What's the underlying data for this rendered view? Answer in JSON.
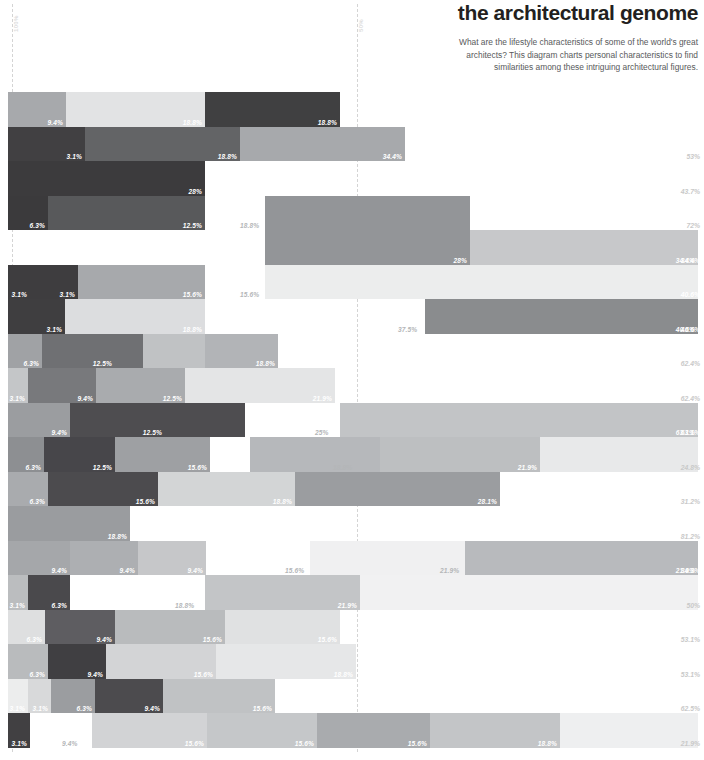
{
  "header": {
    "title": "the architectural genome",
    "subtitle": "What are the lifestyle characteristics of some of the world's great architects? This diagram charts personal characteristics to find similarities among these intriguing architectural figures."
  },
  "axis": {
    "guides": [
      {
        "label": "100%",
        "x": 12
      },
      {
        "label": "50%",
        "x": 357
      }
    ],
    "top": 4,
    "bottom": 752,
    "color": "#d4d4d4"
  },
  "chart_data": {
    "type": "bar",
    "orientation": "horizontal",
    "stacked": true,
    "title": "the architectural genome",
    "xlabel": "",
    "ylabel": "",
    "xlim": [
      0,
      704
    ],
    "grid": false,
    "legend": null,
    "axis_ticks": [
      "100%",
      "50%"
    ],
    "chart_left": 8,
    "chart_right": 698,
    "row_top": 92,
    "row_height": 34.5,
    "rows": [
      {
        "index": 0,
        "total": null,
        "segments": [
          {
            "x": 8,
            "w": 58,
            "color": "#a7a9ac",
            "label": ""
          },
          {
            "x": 66,
            "w": 0,
            "color": "#a7a9ac",
            "label": "9.4%"
          },
          {
            "x": 66,
            "w": 0,
            "color": "#e6e7e8",
            "label": ""
          },
          {
            "x": 66,
            "w": 139,
            "color": "#e2e3e4",
            "label": "18.8%"
          },
          {
            "x": 205,
            "w": 135,
            "color": "#404041",
            "label": "18.8%"
          }
        ]
      },
      {
        "index": 1,
        "total": "53%",
        "total_dark": true,
        "segments": [
          {
            "x": 8,
            "w": 77,
            "color": "#414042",
            "label": "3.1%"
          },
          {
            "x": 85,
            "w": 155,
            "color": "#636466",
            "label": "18.8%"
          },
          {
            "x": 240,
            "w": 165,
            "color": "#a7a9ac",
            "label": "34.4%"
          }
        ]
      },
      {
        "index": 2,
        "total": "43.7%",
        "total_dark": true,
        "segments": [
          {
            "x": 8,
            "w": 197,
            "color": "#3c3b3d",
            "label": "28%"
          }
        ]
      },
      {
        "index": 3,
        "total": "72%",
        "total_dark": true,
        "segments": [
          {
            "x": 8,
            "w": 40,
            "color": "#3b3a3c",
            "label": "6.3%"
          },
          {
            "x": 48,
            "w": 157,
            "color": "#58595b",
            "label": "12.5%"
          },
          {
            "x": 265,
            "w": 205,
            "color": "#939598",
            "label": "18.8%",
            "outside": true,
            "out_x": 240
          },
          {
            "x": 265,
            "w": 0,
            "color": "#939598",
            "label": ""
          }
        ]
      },
      {
        "index": 4,
        "total": "34.4%",
        "segments": [
          {
            "x": 265,
            "w": 205,
            "color": "#939598",
            "label": "28%"
          },
          {
            "x": 470,
            "w": 228,
            "color": "#c7c8ca",
            "label": "34.4%"
          }
        ],
        "merge_with_prev": true
      },
      {
        "index": 5,
        "total": "40.6%",
        "segments": [
          {
            "x": 8,
            "w": 22,
            "color": "#3e3d3f",
            "label": "3.1%"
          },
          {
            "x": 30,
            "w": 48,
            "color": "#3e3d3f",
            "label": "3.1%"
          },
          {
            "x": 78,
            "w": 127,
            "color": "#a7a9ac",
            "label": "15.6%"
          },
          {
            "x": 265,
            "w": 433,
            "color": "#eceded",
            "label": "15.6%",
            "outside": true,
            "out_x": 240
          }
        ]
      },
      {
        "index": 6,
        "total": "40.6%",
        "segments": [
          {
            "x": 8,
            "w": 57,
            "color": "#3f3e40",
            "label": "3.1%"
          },
          {
            "x": 65,
            "w": 140,
            "color": "#dcdddf",
            "label": "18.8%"
          },
          {
            "x": 425,
            "w": 273,
            "color": "#8a8c8e",
            "label": "40.6%",
            "outside_left": "37.5%",
            "out_x": 398
          }
        ]
      },
      {
        "index": 7,
        "total": "62.4%",
        "total_dark": true,
        "segments": [
          {
            "x": 8,
            "w": 34,
            "color": "#a0a2a5",
            "label": "6.3%"
          },
          {
            "x": 42,
            "w": 73,
            "color": "#6f7073",
            "label": "12.5%"
          },
          {
            "x": 115,
            "w": 28,
            "color": "#6f7073",
            "label": ""
          },
          {
            "x": 143,
            "w": 62,
            "color": "#c0c2c4",
            "label": ""
          },
          {
            "x": 205,
            "w": 73,
            "color": "#b2b4b7",
            "label": "18.8%"
          }
        ]
      },
      {
        "index": 8,
        "total": "62.4%",
        "total_dark": true,
        "segments": [
          {
            "x": 8,
            "w": 20,
            "color": "#c4c6c8",
            "label": "3.1%"
          },
          {
            "x": 28,
            "w": 68,
            "color": "#78797c",
            "label": "9.4%"
          },
          {
            "x": 96,
            "w": 89,
            "color": "#a9abae",
            "label": "12.5%"
          },
          {
            "x": 185,
            "w": 150,
            "color": "#e4e5e6",
            "label": "21.9%"
          }
        ]
      },
      {
        "index": 9,
        "total": "63.1%",
        "segments": [
          {
            "x": 8,
            "w": 62,
            "color": "#9b9da0",
            "label": "9.4%"
          },
          {
            "x": 70,
            "w": 95,
            "color": "#4e4d50",
            "label": "12.5%"
          },
          {
            "x": 165,
            "w": 80,
            "color": "#4e4d50",
            "label": ""
          },
          {
            "x": 340,
            "w": 358,
            "color": "#c2c4c6",
            "label": "63.1%",
            "outside_left": "25%",
            "out_x": 315
          }
        ]
      },
      {
        "index": 10,
        "total": "24.8%",
        "total_dark": true,
        "segments": [
          {
            "x": 8,
            "w": 36,
            "color": "#8d8f92",
            "label": "6.3%"
          },
          {
            "x": 44,
            "w": 71,
            "color": "#47464a",
            "label": "12.5%"
          },
          {
            "x": 115,
            "w": 95,
            "color": "#9ea0a3",
            "label": "15.6%"
          },
          {
            "x": 250,
            "w": 130,
            "color": "#b6b8bb",
            "label": "18.8%",
            "outside": true,
            "out_x": 333
          },
          {
            "x": 380,
            "w": 160,
            "color": "#bdbfc1",
            "label": "21.9%"
          },
          {
            "x": 540,
            "w": 158,
            "color": "#e8e9ea",
            "label": ""
          }
        ]
      },
      {
        "index": 11,
        "total": "31.2%",
        "total_dark": true,
        "segments": [
          {
            "x": 8,
            "w": 40,
            "color": "#a9abae",
            "label": "6.3%"
          },
          {
            "x": 48,
            "w": 110,
            "color": "#4c4b4e",
            "label": "15.6%"
          },
          {
            "x": 158,
            "w": 137,
            "color": "#d3d5d6",
            "label": ""
          },
          {
            "x": 295,
            "w": 0,
            "color": "#d3d5d6",
            "label": "18.8%"
          },
          {
            "x": 295,
            "w": 205,
            "color": "#9b9da0",
            "label": "28.1%"
          }
        ]
      },
      {
        "index": 12,
        "total": "81.2%",
        "total_dark": true,
        "segments": [
          {
            "x": 8,
            "w": 122,
            "color": "#9a9c9f",
            "label": "18.8%"
          }
        ]
      },
      {
        "index": 13,
        "total": "34.3%",
        "segments": [
          {
            "x": 8,
            "w": 62,
            "color": "#a5a7aa",
            "label": "9.4%"
          },
          {
            "x": 70,
            "w": 68,
            "color": "#adafb2",
            "label": "9.4%"
          },
          {
            "x": 138,
            "w": 68,
            "color": "#c6c7c9",
            "label": "9.4%"
          },
          {
            "x": 310,
            "w": 155,
            "color": "#f0f0f1",
            "label": "15.6%",
            "outside": true,
            "out_x": 285
          },
          {
            "x": 465,
            "w": 233,
            "color": "#b8babd",
            "label": "21.9%",
            "outside_left": "21.9%",
            "out_x": 440
          }
        ]
      },
      {
        "index": 14,
        "total": "50%",
        "total_dark": true,
        "segments": [
          {
            "x": 8,
            "w": 20,
            "color": "#bbbdbf",
            "label": "3.1%"
          },
          {
            "x": 28,
            "w": 42,
            "color": "#4a494c",
            "label": "6.3%"
          },
          {
            "x": 70,
            "w": 135,
            "color": "#ffffff",
            "label": "18.8%",
            "outside": true,
            "out_x": 175
          },
          {
            "x": 205,
            "w": 155,
            "color": "#c3c5c7",
            "label": "21.9%"
          },
          {
            "x": 360,
            "w": 338,
            "color": "#f1f1f2",
            "label": ""
          }
        ]
      },
      {
        "index": 15,
        "total": "53.1%",
        "total_dark": true,
        "segments": [
          {
            "x": 8,
            "w": 37,
            "color": "#dedfe0",
            "label": "6.3%"
          },
          {
            "x": 45,
            "w": 70,
            "color": "#5e5d61",
            "label": "9.4%"
          },
          {
            "x": 115,
            "w": 110,
            "color": "#b9bbbd",
            "label": "15.6%"
          },
          {
            "x": 225,
            "w": 115,
            "color": "#e0e1e2",
            "label": "15.6%"
          }
        ]
      },
      {
        "index": 16,
        "total": "53.1%",
        "total_dark": true,
        "merge_label_only": true,
        "segments": [
          {
            "x": 8,
            "w": 40,
            "color": "#b9bbbd",
            "label": "6.3%"
          },
          {
            "x": 48,
            "w": 58,
            "color": "#403f42",
            "label": "9.4%"
          },
          {
            "x": 106,
            "w": 110,
            "color": "#d3d4d6",
            "label": "15.6%"
          },
          {
            "x": 216,
            "w": 140,
            "color": "#e6e7e8",
            "label": "18.8%"
          }
        ]
      },
      {
        "index": 17,
        "total": "62.5%",
        "total_dark": true,
        "segments": [
          {
            "x": 8,
            "w": 20,
            "color": "#eceded",
            "label": "3.1%"
          },
          {
            "x": 28,
            "w": 23,
            "color": "#d8d9da",
            "label": "3.1%"
          },
          {
            "x": 51,
            "w": 44,
            "color": "#9b9da0",
            "label": "6.3%"
          },
          {
            "x": 95,
            "w": 68,
            "color": "#4c4b4e",
            "label": "9.4%"
          },
          {
            "x": 163,
            "w": 112,
            "color": "#c0c2c4",
            "label": "15.6%"
          }
        ]
      },
      {
        "index": 18,
        "total": "21.9%",
        "total_dark": true,
        "segments": [
          {
            "x": 8,
            "w": 22,
            "color": "#414042",
            "label": "3.1%"
          },
          {
            "x": 30,
            "w": 62,
            "color": "#ffffff",
            "label": "9.4%",
            "outside": true,
            "out_x": 62
          },
          {
            "x": 92,
            "w": 115,
            "color": "#d2d3d5",
            "label": "15.6%"
          },
          {
            "x": 207,
            "w": 110,
            "color": "#c5c7c9",
            "label": "15.6%"
          },
          {
            "x": 317,
            "w": 113,
            "color": "#a9abae",
            "label": "15.6%"
          },
          {
            "x": 430,
            "w": 130,
            "color": "#c3c5c7",
            "label": "18.8%"
          },
          {
            "x": 560,
            "w": 138,
            "color": "#eeeff0",
            "label": ""
          }
        ]
      }
    ]
  }
}
